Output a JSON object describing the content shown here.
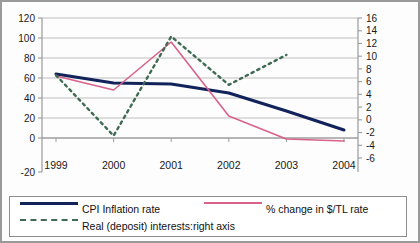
{
  "chart_data": {
    "type": "line",
    "title": "",
    "xlabel": "",
    "ylabel": "",
    "categories": [
      "1999",
      "2000",
      "2001",
      "2002",
      "2003",
      "2004"
    ],
    "x_tick_labels": [
      "1999",
      "2000",
      "2001",
      "2002",
      "2003",
      "2004"
    ],
    "left_axis": {
      "label": "",
      "ylim": [
        -20,
        120
      ],
      "ticks": [
        -20,
        0,
        20,
        40,
        60,
        80,
        100,
        120
      ],
      "tick_labels": [
        "-20",
        "0",
        "20",
        "40",
        "60",
        "80",
        "100",
        "120"
      ]
    },
    "right_axis": {
      "label": "right axis",
      "ylim": [
        -6,
        16
      ],
      "ticks": [
        -6,
        -4,
        -2,
        0,
        2,
        4,
        6,
        8,
        10,
        12,
        14,
        16
      ],
      "tick_labels": [
        "-6",
        "-4",
        "-2",
        "0",
        "2",
        "4",
        "6",
        "8",
        "10",
        "12",
        "14",
        "16"
      ]
    },
    "grid": "horizontal",
    "legend_position": "bottom",
    "series": [
      {
        "name": "CPI Inflation rate",
        "axis": "left",
        "style": "solid",
        "color": "#12235c",
        "values": [
          64,
          55,
          54,
          45,
          27,
          8
        ]
      },
      {
        "name": "% change in $/TL rate",
        "axis": "left",
        "style": "solid",
        "color": "#d9628c",
        "values": [
          62,
          48,
          96,
          22,
          -1,
          -3
        ]
      },
      {
        "name": "Real (deposit) interests:right axis",
        "axis": "right",
        "style": "dashed",
        "color": "#3f6b52",
        "values": [
          7.0,
          -2.5,
          13.1,
          5.5,
          10.2,
          null
        ]
      }
    ]
  },
  "legend": {
    "items": [
      {
        "label": "CPI Inflation rate",
        "swatch": "solid-navy"
      },
      {
        "label": "% change in $/TL rate",
        "swatch": "solid-pink"
      },
      {
        "label": "Real (deposit) interests:right axis",
        "swatch": "dash-green"
      }
    ]
  }
}
